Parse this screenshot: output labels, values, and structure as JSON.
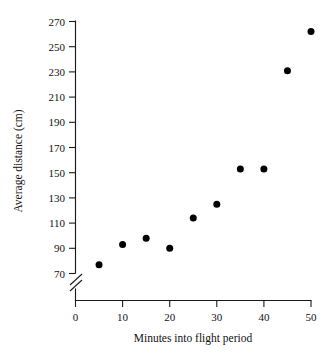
{
  "chart_data": {
    "type": "scatter",
    "title": "",
    "xlabel": "Minutes into flight period",
    "ylabel": "Average distance (cm)",
    "x": [
      5,
      10,
      15,
      20,
      25,
      30,
      35,
      40,
      45,
      50
    ],
    "values": [
      77,
      93,
      98,
      90,
      114,
      125,
      153,
      153,
      231,
      262
    ],
    "series": [
      {
        "name": "Average distance",
        "points": [
          {
            "x": 5,
            "y": 77
          },
          {
            "x": 10,
            "y": 93
          },
          {
            "x": 15,
            "y": 98
          },
          {
            "x": 20,
            "y": 90
          },
          {
            "x": 25,
            "y": 114
          },
          {
            "x": 30,
            "y": 125
          },
          {
            "x": 35,
            "y": 153
          },
          {
            "x": 40,
            "y": 153
          },
          {
            "x": 45,
            "y": 231
          },
          {
            "x": 50,
            "y": 262
          }
        ]
      }
    ],
    "xlim": [
      0,
      50
    ],
    "ylim": [
      70,
      270
    ],
    "xticks": [
      "0",
      "10",
      "20",
      "30",
      "40",
      "50"
    ],
    "xtick_values": [
      0,
      10,
      20,
      30,
      40,
      50
    ],
    "yticks": [
      "70",
      "90",
      "110",
      "130",
      "150",
      "170",
      "190",
      "210",
      "230",
      "250",
      "270"
    ],
    "ytick_values": [
      70,
      90,
      110,
      130,
      150,
      170,
      190,
      210,
      230,
      250,
      270
    ],
    "grid": false,
    "legend": false,
    "legend_position": "none",
    "axis_break": {
      "axis": "y",
      "symbol": "//",
      "below_value": 70
    },
    "marker": {
      "shape": "circle",
      "filled": true,
      "color": "#000000",
      "size": 7
    },
    "colors": {
      "background": "#ffffff",
      "axis": "#1a1a1a",
      "text": "#111111",
      "point": "#000000"
    }
  }
}
